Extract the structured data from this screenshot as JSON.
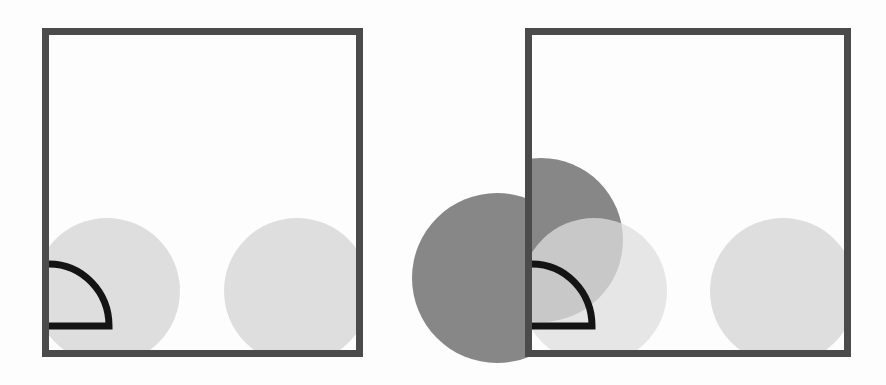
{
  "canvas": {
    "width": 886,
    "height": 385,
    "background": "#fdfdfd"
  },
  "colors": {
    "frame_stroke": "#4b4b4b",
    "light_circle": "#dedede",
    "dark_circle": "#878787",
    "arc_stroke": "#141414",
    "panel_fill": "#ffffff"
  },
  "panels": [
    {
      "id": "left",
      "frame": {
        "x": 45.5,
        "y": 31.5,
        "w": 314,
        "h": 322,
        "stroke_width": 7
      },
      "clip": {
        "x": 49,
        "y": 35,
        "w": 307,
        "h": 315
      },
      "light_circles": [
        {
          "cx": 107,
          "cy": 291,
          "r": 73
        },
        {
          "cx": 297,
          "cy": 291,
          "r": 73
        }
      ],
      "dark_circles": [],
      "quarter_arc": {
        "cx": 49,
        "cy": 326,
        "rx": 60,
        "ry": 62,
        "stroke_width": 7
      }
    },
    {
      "id": "right",
      "frame": {
        "x": 528.5,
        "y": 31.5,
        "w": 319,
        "h": 322,
        "stroke_width": 7
      },
      "clip": {
        "x": 532,
        "y": 35,
        "w": 312,
        "h": 315
      },
      "light_circles": [
        {
          "cx": 594,
          "cy": 291,
          "r": 73,
          "opacity": 0.75
        },
        {
          "cx": 783,
          "cy": 291,
          "r": 73
        }
      ],
      "dark_circles": [
        {
          "cx": 541,
          "cy": 240,
          "r": 82,
          "clipped": "inside"
        },
        {
          "cx": 497,
          "cy": 278,
          "r": 85,
          "clipped": "outside-left",
          "clip_max_x": 528
        }
      ],
      "quarter_arc": {
        "cx": 532,
        "cy": 326,
        "rx": 60,
        "ry": 62,
        "stroke_width": 7
      }
    }
  ]
}
